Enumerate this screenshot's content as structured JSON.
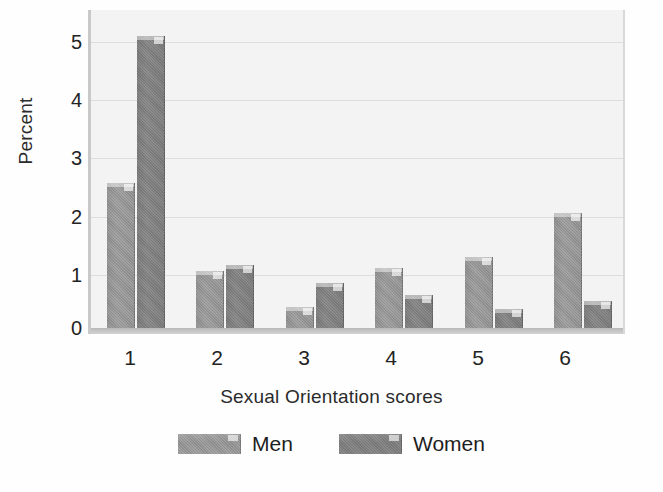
{
  "chart_data": {
    "type": "bar",
    "title": "",
    "subtitle": "",
    "xlabel": "Sexual Orientation scores",
    "ylabel": "Percent",
    "categories": [
      "1",
      "2",
      "3",
      "4",
      "5",
      "6"
    ],
    "series": [
      {
        "name": "Men",
        "values": [
          2.5,
          1.0,
          0.4,
          1.05,
          1.25,
          2.0
        ]
      },
      {
        "name": "Women",
        "values": [
          5.0,
          1.1,
          0.8,
          0.6,
          0.35,
          0.5
        ]
      }
    ],
    "ylim": [
      0,
      5.45
    ],
    "yticks": [
      0,
      1,
      2,
      3,
      4,
      5
    ],
    "ytick_labels": [
      "0",
      "1",
      "2",
      "3",
      "4",
      "5"
    ],
    "xtick_labels": [
      "1",
      "2",
      "3",
      "4",
      "5",
      "6"
    ],
    "grid": "horizontal",
    "legend_position": "bottom",
    "colors": {
      "men": "#979797",
      "women": "#7e7e7e",
      "plot_background": "#f3f3f3",
      "gridline": "#dddddd",
      "axis": "#c9c9c9",
      "text": "#232323"
    }
  },
  "axes": {
    "y_title": "Percent",
    "x_title": "Sexual Orientation scores"
  },
  "legend": {
    "items": [
      {
        "label": "Men",
        "swatch": "men"
      },
      {
        "label": "Women",
        "swatch": "women"
      }
    ]
  }
}
